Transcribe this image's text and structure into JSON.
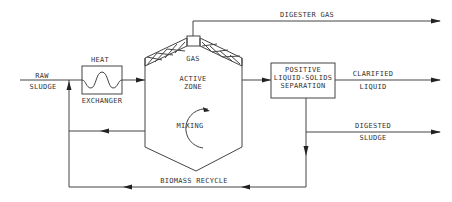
{
  "diagram": {
    "type": "anaerobic digester process flow",
    "labels": {
      "raw": "RAW",
      "sludge": "SLUDGE",
      "heat": "HEAT",
      "exchanger": "EXCHANGER",
      "gas": "GAS",
      "active": "ACTIVE",
      "zone": "ZONE",
      "mixing": "MIXING",
      "digester_gas": "DIGESTER GAS",
      "positive": "POSITIVE",
      "liquid_solids": "LIQUID-SOLIDS",
      "separation": "SEPARATION",
      "clarified": "CLARIFIED",
      "liquid": "LIQUID",
      "digested": "DIGESTED",
      "digested_sludge": "SLUDGE",
      "biomass_recycle": "BIOMASS RECYCLE"
    },
    "nodes": [
      {
        "id": "heat-exchanger",
        "label": "HEAT EXCHANGER"
      },
      {
        "id": "digester",
        "label": "ACTIVE ZONE"
      },
      {
        "id": "separator",
        "label": "POSITIVE LIQUID-SOLIDS SEPARATION"
      }
    ],
    "flows": [
      {
        "from": "input",
        "to": "heat-exchanger",
        "label": "RAW SLUDGE"
      },
      {
        "from": "heat-exchanger",
        "to": "digester"
      },
      {
        "from": "digester",
        "to": "output",
        "label": "DIGESTER GAS"
      },
      {
        "from": "digester",
        "to": "separator"
      },
      {
        "from": "separator",
        "to": "output",
        "label": "CLARIFIED LIQUID"
      },
      {
        "from": "separator",
        "to": "output",
        "label": "DIGESTED SLUDGE"
      },
      {
        "from": "separator",
        "to": "input",
        "label": "BIOMASS RECYCLE"
      },
      {
        "from": "digester",
        "to": "input",
        "label": "recycle"
      }
    ],
    "colors": {
      "line": "#444444",
      "text": "#333333",
      "background": "#ffffff"
    }
  }
}
